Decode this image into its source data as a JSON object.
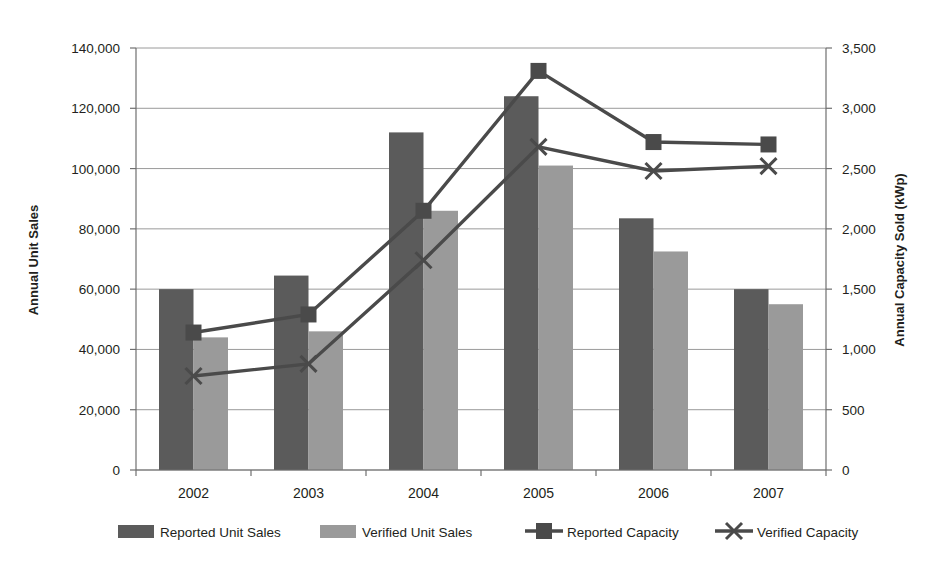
{
  "chart_data": {
    "type": "bar",
    "title": "",
    "subtitle": "",
    "xlabel": "",
    "ylabel": "Annual Unit Sales",
    "y2label": "Annual Capacity Sold (kWp)",
    "categories": [
      "2002",
      "2003",
      "2004",
      "2005",
      "2006",
      "2007"
    ],
    "ylim": [
      0,
      140000
    ],
    "y2lim": [
      0,
      3500
    ],
    "yticks": [
      "0",
      "20,000",
      "40,000",
      "60,000",
      "80,000",
      "100,000",
      "120,000",
      "140,000"
    ],
    "ytick_values": [
      0,
      20000,
      40000,
      60000,
      80000,
      100000,
      120000,
      140000
    ],
    "y2ticks": [
      "0",
      "500",
      "1,000",
      "1,500",
      "2,000",
      "2,500",
      "3,000",
      "3,500"
    ],
    "y2tick_values": [
      0,
      500,
      1000,
      1500,
      2000,
      2500,
      3000,
      3500
    ],
    "grid": true,
    "legend_position": "bottom",
    "series": [
      {
        "name": "Reported Unit Sales",
        "kind": "bar",
        "axis": "left",
        "color": "#5b5b5b",
        "values": [
          60000,
          64500,
          112000,
          124000,
          83500,
          60000
        ]
      },
      {
        "name": "Verified  Unit Sales",
        "kind": "bar",
        "axis": "left",
        "color": "#9a9a9a",
        "values": [
          44000,
          46000,
          86000,
          101000,
          72500,
          55000
        ]
      },
      {
        "name": "Reported Capacity",
        "kind": "line",
        "axis": "right",
        "marker": "square",
        "color": "#4a4a4a",
        "values": [
          1140,
          1290,
          2150,
          3310,
          2720,
          2700
        ]
      },
      {
        "name": "Verified Capacity",
        "kind": "line",
        "axis": "right",
        "marker": "x",
        "color": "#4a4a4a",
        "values": [
          780,
          880,
          1740,
          2680,
          2480,
          2520
        ]
      }
    ]
  },
  "legend": {
    "items": [
      {
        "label": "Reported Unit Sales",
        "swatch": "bar-dark"
      },
      {
        "label": "Verified  Unit Sales",
        "swatch": "bar-light"
      },
      {
        "label": "Reported Capacity",
        "swatch": "line-square"
      },
      {
        "label": "Verified Capacity",
        "swatch": "line-x"
      }
    ]
  },
  "colors": {
    "bar_reported": "#5b5b5b",
    "bar_verified": "#9a9a9a",
    "line": "#4a4a4a",
    "grid": "#9a9a9a",
    "axis": "#6f6f6f",
    "text": "#231f20",
    "background": "#ffffff"
  }
}
